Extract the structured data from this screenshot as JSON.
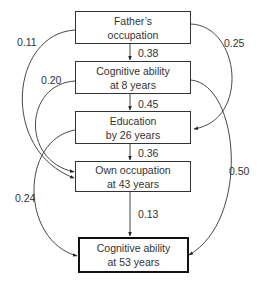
{
  "diagram": {
    "type": "path-diagram",
    "nodes": [
      {
        "id": "fathers_occupation",
        "line1": "Father’s",
        "line2": "occupation"
      },
      {
        "id": "cog_8",
        "line1": "Cognitive ability",
        "line2": "at 8 years"
      },
      {
        "id": "education_26",
        "line1": "Education",
        "line2": "by 26 years"
      },
      {
        "id": "occupation_43",
        "line1": "Own occupation",
        "line2": "at 43 years"
      },
      {
        "id": "cog_53",
        "line1": "Cognitive ability",
        "line2": "at 53 years"
      }
    ],
    "edges": [
      {
        "from": "fathers_occupation",
        "to": "cog_8",
        "coef": "0.38"
      },
      {
        "from": "cog_8",
        "to": "education_26",
        "coef": "0.45"
      },
      {
        "from": "education_26",
        "to": "occupation_43",
        "coef": "0.36"
      },
      {
        "from": "occupation_43",
        "to": "cog_53",
        "coef": "0.13"
      },
      {
        "from": "fathers_occupation",
        "to": "occupation_43",
        "coef": "0.11"
      },
      {
        "from": "cog_8",
        "to": "occupation_43",
        "coef": "0.20"
      },
      {
        "from": "education_26",
        "to": "cog_53",
        "coef": "0.24"
      },
      {
        "from": "fathers_occupation",
        "to": "education_26",
        "coef": "0.25"
      },
      {
        "from": "cog_8",
        "to": "cog_53",
        "coef": "0.50"
      }
    ]
  }
}
